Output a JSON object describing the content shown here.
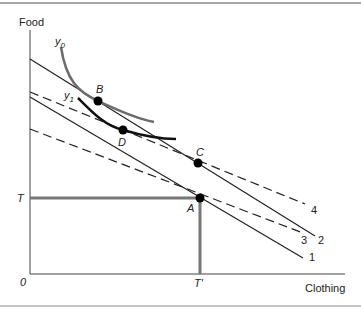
{
  "axes": {
    "y_label": "Food",
    "x_label": "Clothing",
    "origin_label": "0",
    "y_tick_label": "T",
    "x_tick_label": "T'"
  },
  "lines": [
    {
      "id": "1",
      "label": "1",
      "style": "solid"
    },
    {
      "id": "2",
      "label": "2",
      "style": "solid"
    },
    {
      "id": "3",
      "label": "3",
      "style": "dashed"
    },
    {
      "id": "4",
      "label": "4",
      "style": "dashed"
    }
  ],
  "curves": [
    {
      "id": "y0",
      "label": "y",
      "sub": "0",
      "color": "#6b6b6b"
    },
    {
      "id": "y1",
      "label": "y",
      "sub": "1",
      "color": "#111111"
    }
  ],
  "points": [
    {
      "id": "A",
      "label": "A"
    },
    {
      "id": "B",
      "label": "B"
    },
    {
      "id": "C",
      "label": "C"
    },
    {
      "id": "D",
      "label": "D"
    }
  ],
  "colors": {
    "frame": "#888888",
    "endowment": "#777777",
    "line": "#222222"
  }
}
